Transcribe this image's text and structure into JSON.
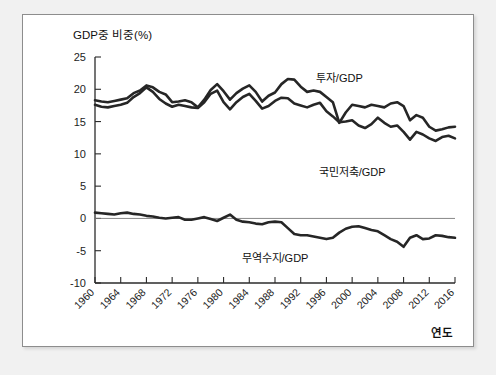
{
  "chart_data": {
    "type": "line",
    "title": "",
    "ylabel": "GDP중 비중(%)",
    "xlabel": "연도",
    "ylim": [
      -10,
      25
    ],
    "yticks": [
      "25",
      "20",
      "15",
      "10",
      "5",
      "0",
      "-5",
      "-10"
    ],
    "ytick_values": [
      25,
      20,
      15,
      10,
      5,
      0,
      -5,
      -10
    ],
    "xlim": [
      1960,
      2016
    ],
    "xticks": [
      "1960",
      "1964",
      "1968",
      "1972",
      "1976",
      "1980",
      "1984",
      "1988",
      "1992",
      "1996",
      "2000",
      "2004",
      "2008",
      "2012",
      "2016"
    ],
    "xtick_values": [
      1960,
      1964,
      1968,
      1972,
      1976,
      1980,
      1984,
      1988,
      1992,
      1996,
      2000,
      2004,
      2008,
      2012,
      2016
    ],
    "grid": false,
    "legend_position": "inline-annotations",
    "x": [
      1960,
      1961,
      1962,
      1963,
      1964,
      1965,
      1966,
      1967,
      1968,
      1969,
      1970,
      1971,
      1972,
      1973,
      1974,
      1975,
      1976,
      1977,
      1978,
      1979,
      1980,
      1981,
      1982,
      1983,
      1984,
      1985,
      1986,
      1987,
      1988,
      1989,
      1990,
      1991,
      1992,
      1993,
      1994,
      1995,
      1996,
      1997,
      1998,
      1999,
      2000,
      2001,
      2002,
      2003,
      2004,
      2005,
      2006,
      2007,
      2008,
      2009,
      2010,
      2011,
      2012,
      2013,
      2014,
      2015,
      2016
    ],
    "series": [
      {
        "name": "투자/GDP",
        "label": "투자/GDP",
        "color": "#262626",
        "values": [
          18.3,
          18.1,
          18.0,
          18.2,
          18.4,
          18.6,
          19.4,
          19.8,
          20.6,
          20.3,
          19.6,
          19.2,
          18.0,
          18.1,
          18.3,
          18.0,
          17.2,
          18.4,
          19.9,
          20.8,
          19.7,
          18.4,
          19.4,
          20.1,
          20.6,
          19.6,
          18.1,
          19.0,
          19.5,
          20.8,
          21.6,
          21.5,
          20.4,
          19.6,
          19.8,
          19.6,
          18.8,
          18.0,
          14.8,
          16.4,
          17.6,
          17.4,
          17.2,
          17.6,
          17.4,
          17.2,
          17.8,
          18.0,
          17.4,
          15.2,
          16.0,
          15.6,
          14.2,
          13.6,
          13.8,
          14.1,
          14.2
        ]
      },
      {
        "name": "국민저축/GDP",
        "label": "국민저축/GDP",
        "color": "#262626",
        "values": [
          17.6,
          17.3,
          17.2,
          17.4,
          17.6,
          17.9,
          18.8,
          19.4,
          20.3,
          19.6,
          18.5,
          17.8,
          17.3,
          17.6,
          17.4,
          17.2,
          17.1,
          18.0,
          19.3,
          19.8,
          18.0,
          16.9,
          18.0,
          18.8,
          19.3,
          18.2,
          17.0,
          17.4,
          18.2,
          18.7,
          18.6,
          17.8,
          17.5,
          17.2,
          17.6,
          17.9,
          16.6,
          15.8,
          14.9,
          15.0,
          15.2,
          14.4,
          14.0,
          14.6,
          15.6,
          14.8,
          14.2,
          14.4,
          13.4,
          12.2,
          13.4,
          13.0,
          12.4,
          12.0,
          12.6,
          12.8,
          12.4
        ]
      },
      {
        "name": "무역수지/GDP",
        "label": "무역수지/GDP",
        "color": "#262626",
        "values": [
          0.9,
          0.8,
          0.7,
          0.6,
          0.8,
          0.9,
          0.7,
          0.6,
          0.4,
          0.3,
          0.1,
          0.0,
          0.1,
          0.2,
          -0.2,
          -0.2,
          0.0,
          0.2,
          -0.1,
          -0.4,
          0.1,
          0.6,
          -0.2,
          -0.5,
          -0.6,
          -0.8,
          -0.9,
          -0.6,
          -0.5,
          -0.6,
          -1.5,
          -2.4,
          -2.6,
          -2.6,
          -2.8,
          -3.0,
          -3.2,
          -3.0,
          -2.2,
          -1.6,
          -1.3,
          -1.2,
          -1.5,
          -1.8,
          -2.0,
          -2.6,
          -3.2,
          -3.6,
          -4.4,
          -3.0,
          -2.6,
          -3.2,
          -3.1,
          -2.6,
          -2.7,
          -2.9,
          -3.0
        ]
      }
    ]
  },
  "annotations": [
    {
      "text": "투자/GDP",
      "x": 1998,
      "y": 21.2
    },
    {
      "text": "국민저축/GDP",
      "x": 2000,
      "y": 6.6
    },
    {
      "text": "무역수지/GDP",
      "x": 1988,
      "y": -6.8
    }
  ],
  "axis": {
    "y_title": "GDP중 비중(%)",
    "x_title": "연도"
  }
}
